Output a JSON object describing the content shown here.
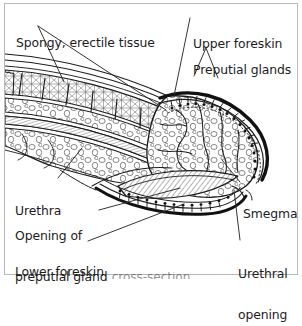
{
  "figure": {
    "style": {
      "ink": "#1c1c1c",
      "frame_border": "#b9b9b9",
      "background": "#ffffff",
      "leader_line": "#2a2a2a"
    }
  },
  "labels": {
    "spongy": "Spongy, erectile tissue",
    "upper_foreskin": "Upper foreskin",
    "preputial_glands": "Preputial glands",
    "urethra": "Urethra",
    "opening_line1": "Opening of",
    "opening_line2": "preputial gland",
    "lower_foreskin": "Lower foreskin",
    "smegma": "Smegma",
    "urethral_line1": "Urethral",
    "urethral_line2": "opening",
    "clipped_caption": "cross-section"
  }
}
